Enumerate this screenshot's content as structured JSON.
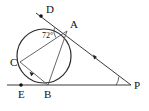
{
  "diagram": {
    "background_color": "#ffffff",
    "line_color": "#3a3a3a",
    "circle_color": "#2b2b2b",
    "chord_color": "#555555",
    "label_color": "#111111",
    "width": 149,
    "height": 111
  },
  "angles": [
    {
      "name": "angle-at-a",
      "label": "72°",
      "value": 72,
      "unit": "degrees",
      "vertex": "A",
      "label_x": 49,
      "label_y": 36
    }
  ],
  "points": [
    {
      "name": "point-d",
      "label": "D",
      "x": 41,
      "y": 16,
      "label_x": 46,
      "label_y": 13,
      "has_dot": true
    },
    {
      "name": "point-a",
      "label": "A",
      "x": 67,
      "y": 31,
      "label_x": 70,
      "label_y": 28,
      "has_dot": false
    },
    {
      "name": "point-c",
      "label": "C",
      "x": 20,
      "y": 62,
      "label_x": 10,
      "label_y": 65,
      "has_dot": false
    },
    {
      "name": "point-e",
      "label": "E",
      "x": 21,
      "y": 85,
      "label_x": 18,
      "label_y": 97,
      "has_dot": true
    },
    {
      "name": "point-b",
      "label": "B",
      "x": 48,
      "y": 85,
      "label_x": 45,
      "label_y": 97,
      "has_dot": false
    },
    {
      "name": "point-p",
      "label": "P",
      "x": 130,
      "y": 85,
      "label_x": 134,
      "label_y": 89,
      "has_dot": false
    }
  ],
  "circle": {
    "name": "main-circle",
    "center_x": 44,
    "center_y": 56,
    "radius": 27
  },
  "segments": [
    {
      "name": "line-d-to-p",
      "from": "D",
      "to": "P",
      "x1": 36,
      "y1": 13,
      "x2": 131,
      "y2": 85
    },
    {
      "name": "line-e-to-p",
      "from": "E",
      "to": "P",
      "x1": 7,
      "y1": 85,
      "x2": 131,
      "y2": 85
    },
    {
      "name": "chord-a-to-c",
      "from": "A",
      "to": "C",
      "x1": 67,
      "y1": 31,
      "x2": 20,
      "y2": 62
    },
    {
      "name": "chord-a-to-b",
      "from": "A",
      "to": "B",
      "x1": 67,
      "y1": 31,
      "x2": 48,
      "y2": 85
    },
    {
      "name": "chord-c-to-b",
      "from": "C",
      "to": "B",
      "x1": 20,
      "y1": 62,
      "x2": 48,
      "y2": 85
    }
  ],
  "markers": [
    {
      "name": "arrow-marker-on-ap",
      "x": 97,
      "y": 57,
      "rotation": 37
    },
    {
      "name": "arrow-marker-on-cb",
      "x": 33,
      "y": 72,
      "rotation": 40
    }
  ],
  "angle_arcs": [
    {
      "name": "arc-at-a",
      "cx": 67,
      "cy": 31,
      "r": 13,
      "start": 150,
      "end": 212
    },
    {
      "name": "arc-at-p",
      "cx": 130,
      "cy": 85,
      "r": 14,
      "start": 180,
      "end": 217
    }
  ]
}
